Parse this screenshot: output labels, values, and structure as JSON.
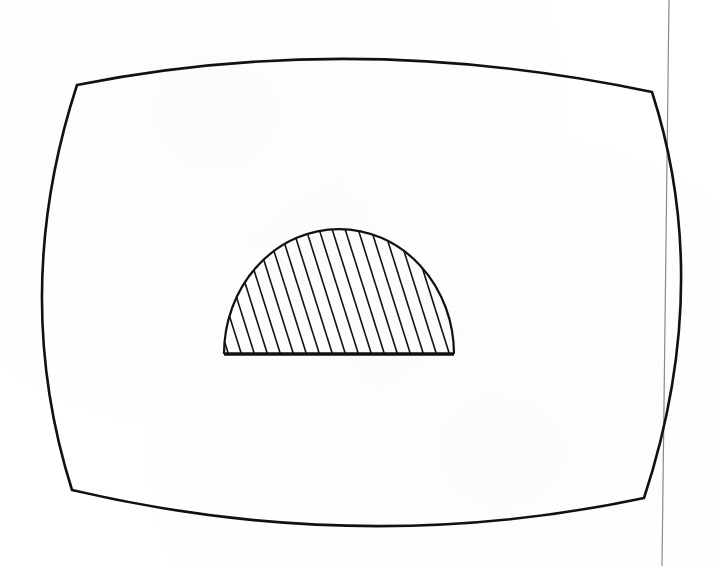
{
  "diagram": {
    "background_color": "#ffffff",
    "stroke_color": "#111111",
    "margin_line_color": "#8a8a8a",
    "screen_outline": {
      "corners": {
        "top_left": [
          77,
          85
        ],
        "top_right": [
          652,
          92
        ],
        "bottom_right": [
          644,
          498
        ],
        "bottom_left": [
          72,
          490
        ]
      },
      "edge_bulge_points": {
        "top": [
          360,
          59
        ],
        "right": [
          681,
          290
        ],
        "bottom": [
          360,
          526
        ],
        "left": [
          42,
          290
        ]
      },
      "stroke_width": 2.6
    },
    "semicircle": {
      "center": [
        339,
        354
      ],
      "radius_x": 115,
      "radius_y": 125,
      "baseline_y": 354,
      "baseline_left_x": 224,
      "baseline_right_x": 454,
      "baseline_stroke_width": 3.5,
      "arc_stroke_width": 2.2,
      "hatch": {
        "spacing": 13,
        "slope_dx_per_dy": 0.315,
        "stroke_width": 1.6
      }
    },
    "margin_line": {
      "top": [
        669,
        0
      ],
      "bottom": [
        662,
        566
      ],
      "stroke_width": 1.2
    }
  }
}
